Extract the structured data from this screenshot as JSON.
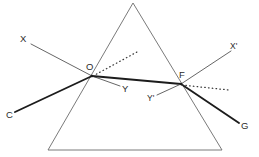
{
  "figure": {
    "type": "geometry-ray-diagram",
    "canvas": {
      "width": 259,
      "height": 157
    },
    "colors": {
      "background": "#ffffff",
      "prism_outline": "#6b6b6b",
      "thin_ray": "#4a4a4a",
      "thick_ray": "#1c1c1c",
      "normal_dotted": "#3a3a3a",
      "label_text": "#2b2b2b"
    },
    "prism": {
      "name": "triangular-prism",
      "apex": {
        "x": 133,
        "y": 3
      },
      "base_left": {
        "x": 48,
        "y": 150
      },
      "base_right": {
        "x": 222,
        "y": 150
      },
      "stroke_width": 0.9
    },
    "points": [
      {
        "id": "O",
        "label": "O",
        "x": 92,
        "y": 76,
        "label_x": 86,
        "label_y": 70
      },
      {
        "id": "F",
        "label": "F",
        "x": 181,
        "y": 84,
        "label_x": 179,
        "label_y": 78
      }
    ],
    "rays": [
      {
        "name": "incident-ray-XO",
        "label": "X",
        "style": "thin",
        "from": {
          "x": 31,
          "y": 44
        },
        "to": {
          "x": 92,
          "y": 76
        },
        "label_x": 20,
        "label_y": 42
      },
      {
        "name": "ray-CO",
        "label": "C",
        "style": "thick",
        "from": {
          "x": 15,
          "y": 112
        },
        "to": {
          "x": 92,
          "y": 76
        },
        "label_x": 6,
        "label_y": 118
      },
      {
        "name": "ray-OY",
        "label": "Y",
        "style": "thin",
        "from": {
          "x": 92,
          "y": 76
        },
        "to": {
          "x": 120,
          "y": 86
        },
        "label_x": 122,
        "label_y": 92
      },
      {
        "name": "refracted-ray-OF",
        "label": "",
        "style": "thick",
        "from": {
          "x": 92,
          "y": 76
        },
        "to": {
          "x": 181,
          "y": 84
        },
        "label_x": 0,
        "label_y": 0
      },
      {
        "name": "emergent-ray-FX-prime",
        "label": "X'",
        "style": "thin",
        "from": {
          "x": 181,
          "y": 84
        },
        "to": {
          "x": 231,
          "y": 51
        },
        "label_x": 230,
        "label_y": 49
      },
      {
        "name": "ray-FG",
        "label": "G",
        "style": "thick",
        "from": {
          "x": 181,
          "y": 84
        },
        "to": {
          "x": 239,
          "y": 123
        },
        "label_x": 241,
        "label_y": 129
      },
      {
        "name": "ray-FY-prime",
        "label": "Y'",
        "style": "thin",
        "from": {
          "x": 181,
          "y": 84
        },
        "to": {
          "x": 157,
          "y": 95
        },
        "label_x": 147,
        "label_y": 101
      }
    ],
    "normals": [
      {
        "name": "normal-at-O",
        "style": "dotted",
        "from": {
          "x": 93,
          "y": 76
        },
        "to": {
          "x": 137,
          "y": 52
        }
      },
      {
        "name": "normal-at-F",
        "style": "dotted",
        "from": {
          "x": 182,
          "y": 85
        },
        "to": {
          "x": 229,
          "y": 90
        }
      }
    ]
  }
}
